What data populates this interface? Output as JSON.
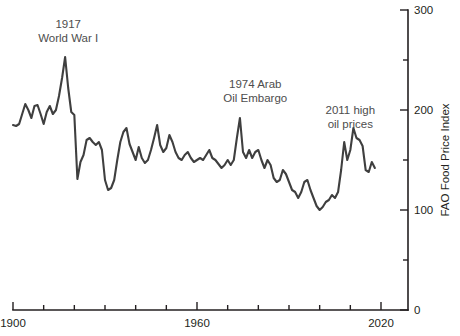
{
  "chart_data": {
    "type": "line",
    "title": "",
    "subtitle": "",
    "xlabel": "",
    "ylabel": "FAO Food Price Index",
    "xlim": [
      1900,
      2020
    ],
    "ylim": [
      0,
      300
    ],
    "grid": false,
    "legend": null,
    "line_color": "#3f3f3f",
    "axis_color": "#231f20",
    "x_ticks_major": [
      1900,
      1960,
      2020
    ],
    "x_ticks_all": [
      1900,
      1910,
      1920,
      1930,
      1940,
      1950,
      1960,
      1970,
      1980,
      1990,
      2000,
      2010,
      2020
    ],
    "x_tick_labels": [
      "1900",
      "",
      "",
      "",
      "",
      "",
      "1960",
      "",
      "",
      "",
      "",
      "",
      "2020"
    ],
    "y_ticks_all": [
      0,
      50,
      100,
      150,
      200,
      250,
      300
    ],
    "y_tick_labels": [
      "0",
      "",
      "100",
      "",
      "200",
      "",
      "300"
    ],
    "annotations": [
      {
        "id": "ww1",
        "lines": [
          "1917",
          "World War I"
        ],
        "x": 1918,
        "y": 282
      },
      {
        "id": "oil-embargo",
        "lines": [
          "1974 Arab",
          "Oil Embargo"
        ],
        "x": 1979,
        "y": 222
      },
      {
        "id": "high-oil",
        "lines": [
          "2011 high",
          "oil prices"
        ],
        "x": 2010,
        "y": 196
      }
    ],
    "x": [
      1900,
      1901,
      1902,
      1903,
      1904,
      1905,
      1906,
      1907,
      1908,
      1909,
      1910,
      1911,
      1912,
      1913,
      1914,
      1915,
      1916,
      1917,
      1918,
      1919,
      1920,
      1921,
      1922,
      1923,
      1924,
      1925,
      1926,
      1927,
      1928,
      1929,
      1930,
      1931,
      1932,
      1933,
      1934,
      1935,
      1936,
      1937,
      1938,
      1939,
      1940,
      1941,
      1942,
      1943,
      1944,
      1945,
      1946,
      1947,
      1948,
      1949,
      1950,
      1951,
      1952,
      1953,
      1954,
      1955,
      1956,
      1957,
      1958,
      1959,
      1960,
      1961,
      1962,
      1963,
      1964,
      1965,
      1966,
      1967,
      1968,
      1969,
      1970,
      1971,
      1972,
      1973,
      1974,
      1975,
      1976,
      1977,
      1978,
      1979,
      1980,
      1981,
      1982,
      1983,
      1984,
      1985,
      1986,
      1987,
      1988,
      1989,
      1990,
      1991,
      1992,
      1993,
      1994,
      1995,
      1996,
      1997,
      1998,
      1999,
      2000,
      2001,
      2002,
      2003,
      2004,
      2005,
      2006,
      2007,
      2008,
      2009,
      2010,
      2011,
      2012,
      2013,
      2014,
      2015,
      2016,
      2017,
      2018
    ],
    "values": [
      185,
      184,
      186,
      196,
      206,
      200,
      192,
      204,
      205,
      196,
      186,
      198,
      204,
      196,
      200,
      214,
      232,
      253,
      222,
      198,
      195,
      131,
      148,
      155,
      170,
      172,
      168,
      165,
      168,
      160,
      130,
      120,
      122,
      130,
      150,
      168,
      178,
      182,
      166,
      158,
      150,
      163,
      152,
      147,
      150,
      160,
      172,
      185,
      165,
      158,
      162,
      175,
      168,
      158,
      152,
      150,
      155,
      158,
      152,
      148,
      150,
      152,
      150,
      155,
      160,
      152,
      150,
      146,
      142,
      145,
      150,
      145,
      150,
      172,
      192,
      158,
      152,
      160,
      152,
      158,
      160,
      150,
      142,
      150,
      145,
      132,
      128,
      130,
      140,
      136,
      128,
      120,
      118,
      112,
      118,
      128,
      130,
      120,
      112,
      104,
      100,
      103,
      108,
      110,
      115,
      112,
      118,
      140,
      168,
      150,
      160,
      182,
      172,
      170,
      164,
      140,
      138,
      148,
      142
    ]
  }
}
